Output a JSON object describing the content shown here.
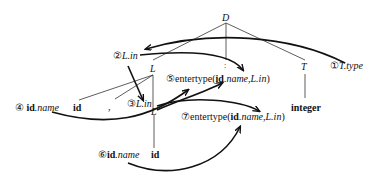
{
  "diagram": {
    "type": "annotated-parse-tree",
    "nodes": {
      "D": "D",
      "L_top": "L",
      "T": "T",
      "L_mid": "L",
      "integer": "integer",
      "id1": "id",
      "comma": ",",
      "id2": "id",
      "dots": ":"
    },
    "annotations": {
      "a1": {
        "num": "①",
        "text": "T.type"
      },
      "a2": {
        "num": "②",
        "text": "L.in"
      },
      "a3": {
        "num": "③",
        "text": "L.in"
      },
      "a4": {
        "num": "④",
        "prefix": "id",
        "text": ".name"
      },
      "a5": {
        "num": "⑤",
        "call": "entertype(",
        "arg1b": "id",
        "arg1": ".name,",
        "arg2": "L.in",
        "close": ")"
      },
      "a6": {
        "num": "⑥",
        "prefix": "id",
        "text": ".name"
      },
      "a7": {
        "num": "⑦",
        "call": "entertype(",
        "arg1b": "id",
        "arg1": ".name,",
        "arg2": "L.in",
        "close": ")"
      }
    },
    "colors": {
      "ink": "#111111"
    }
  }
}
